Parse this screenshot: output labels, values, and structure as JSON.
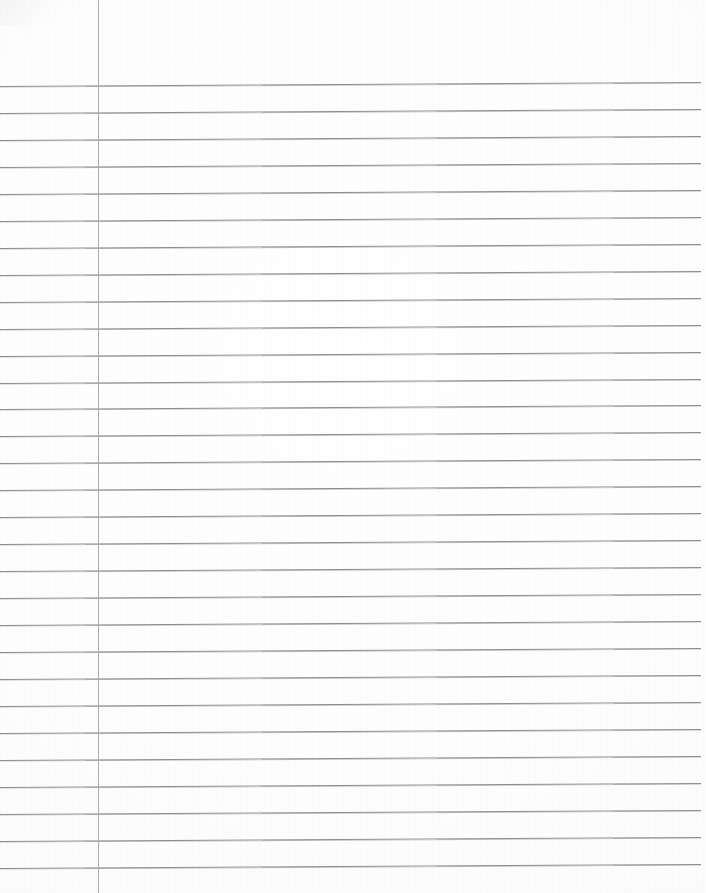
{
  "document": {
    "kind": "scanned-ruled-notebook-paper",
    "title": "",
    "visible_text": "",
    "page_width": 706,
    "page_height": 893,
    "background_color": "#fefefe",
    "is_blank": true
  },
  "paper": {
    "rule_color": "#8e8e90",
    "margin_rule_color": "#a9a9ab",
    "rule_count": 30,
    "first_rule_y": 86,
    "rule_spacing": 26.95,
    "rule_left_x": 0,
    "rule_right_x": 701,
    "rule_skew_rise_px": -4,
    "margin_rule_x": 98,
    "margin_rule_top": 0,
    "margin_rule_bottom": 893
  },
  "rules": [
    {
      "index": 1,
      "y": 86
    },
    {
      "index": 2,
      "y": 113
    },
    {
      "index": 3,
      "y": 140
    },
    {
      "index": 4,
      "y": 167
    },
    {
      "index": 5,
      "y": 194
    },
    {
      "index": 6,
      "y": 221
    },
    {
      "index": 7,
      "y": 248
    },
    {
      "index": 8,
      "y": 275
    },
    {
      "index": 9,
      "y": 302
    },
    {
      "index": 10,
      "y": 329
    },
    {
      "index": 11,
      "y": 356
    },
    {
      "index": 12,
      "y": 383
    },
    {
      "index": 13,
      "y": 409
    },
    {
      "index": 14,
      "y": 436
    },
    {
      "index": 15,
      "y": 463
    },
    {
      "index": 16,
      "y": 490
    },
    {
      "index": 17,
      "y": 517
    },
    {
      "index": 18,
      "y": 544
    },
    {
      "index": 19,
      "y": 571
    },
    {
      "index": 20,
      "y": 598
    },
    {
      "index": 21,
      "y": 625
    },
    {
      "index": 22,
      "y": 652
    },
    {
      "index": 23,
      "y": 679
    },
    {
      "index": 24,
      "y": 706
    },
    {
      "index": 25,
      "y": 733
    },
    {
      "index": 26,
      "y": 760
    },
    {
      "index": 27,
      "y": 787
    },
    {
      "index": 28,
      "y": 814
    },
    {
      "index": 29,
      "y": 841
    },
    {
      "index": 30,
      "y": 868
    }
  ]
}
